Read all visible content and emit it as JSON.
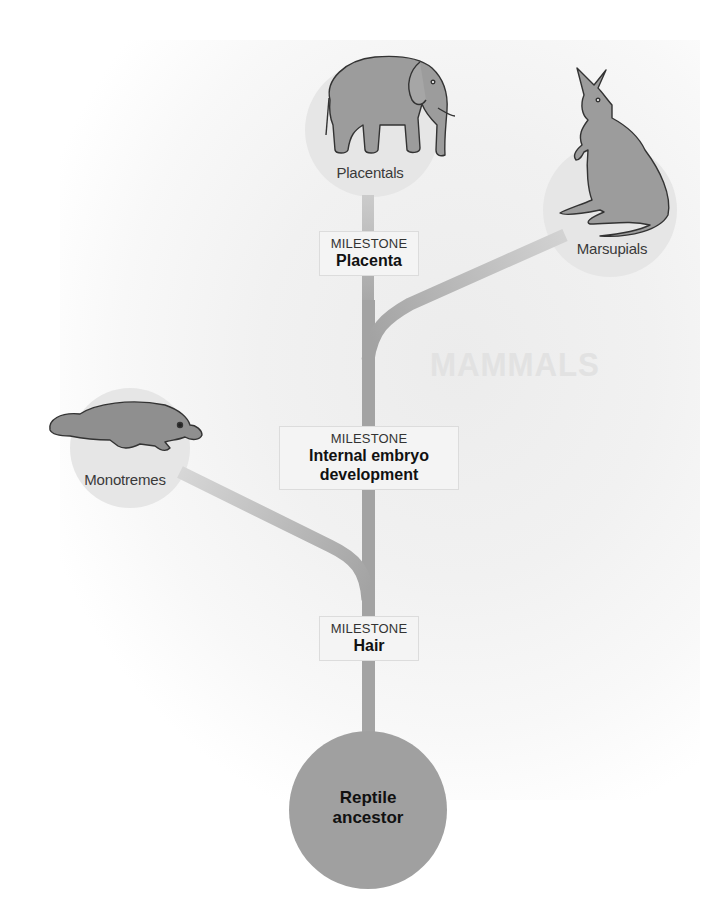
{
  "diagram": {
    "group_label": "MAMMALS",
    "root": {
      "label_line1": "Reptile",
      "label_line2": "ancestor"
    },
    "milestones": [
      {
        "kicker": "MILESTONE",
        "title": "Hair"
      },
      {
        "kicker": "MILESTONE",
        "title_line1": "Internal embryo",
        "title_line2": "development"
      },
      {
        "kicker": "MILESTONE",
        "title": "Placenta"
      }
    ],
    "branches": [
      {
        "label": "Monotremes",
        "icon": "platypus-icon"
      },
      {
        "label": "Marsupials",
        "icon": "kangaroo-icon"
      },
      {
        "label": "Placentals",
        "icon": "elephant-icon"
      }
    ],
    "colors": {
      "trunk": "#a3a3a3",
      "root_circle": "#a0a0a0",
      "branch_circle": "#e4e4e4",
      "animal_fill": "#9c9c9c",
      "animal_stroke": "#333333",
      "group_label": "#e2e2e2"
    }
  }
}
